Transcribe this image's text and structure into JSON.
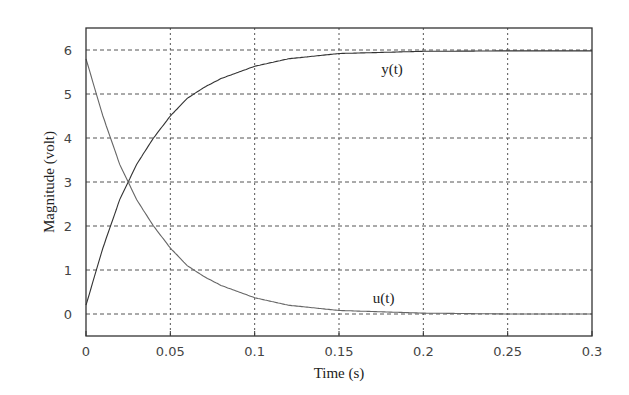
{
  "chart_data": {
    "type": "line",
    "title": "",
    "xlabel": "Time (s)",
    "ylabel": "Magnitude (volt)",
    "xlim": [
      0,
      0.3
    ],
    "ylim": [
      -0.5,
      6.5
    ],
    "grid": true,
    "legend": "none (inline curve labels)",
    "x_ticks": [
      0,
      0.05,
      0.1,
      0.15,
      0.2,
      0.25,
      0.3
    ],
    "x_tick_labels": [
      "0",
      "0.05",
      "0.1",
      "0.15",
      "0.2",
      "0.25",
      "0.3"
    ],
    "y_ticks": [
      0,
      1,
      2,
      3,
      4,
      5,
      6
    ],
    "y_tick_labels": [
      "0",
      "1",
      "2",
      "3",
      "4",
      "5",
      "6"
    ],
    "x": [
      0,
      0.01,
      0.02,
      0.025,
      0.03,
      0.04,
      0.05,
      0.06,
      0.07,
      0.08,
      0.1,
      0.12,
      0.15,
      0.2,
      0.25,
      0.3
    ],
    "series": [
      {
        "name": "y(t)",
        "label_pos": [
          0.175,
          5.45
        ],
        "values": [
          0.2,
          1.5,
          2.6,
          3.0,
          3.4,
          4.0,
          4.5,
          4.9,
          5.15,
          5.35,
          5.63,
          5.8,
          5.92,
          5.97,
          5.98,
          5.98
        ]
      },
      {
        "name": "u(t)",
        "label_pos": [
          0.17,
          0.25
        ],
        "values": [
          5.8,
          4.5,
          3.4,
          3.0,
          2.6,
          2.0,
          1.5,
          1.1,
          0.85,
          0.65,
          0.37,
          0.2,
          0.08,
          0.02,
          0.0,
          0.0
        ]
      }
    ]
  }
}
